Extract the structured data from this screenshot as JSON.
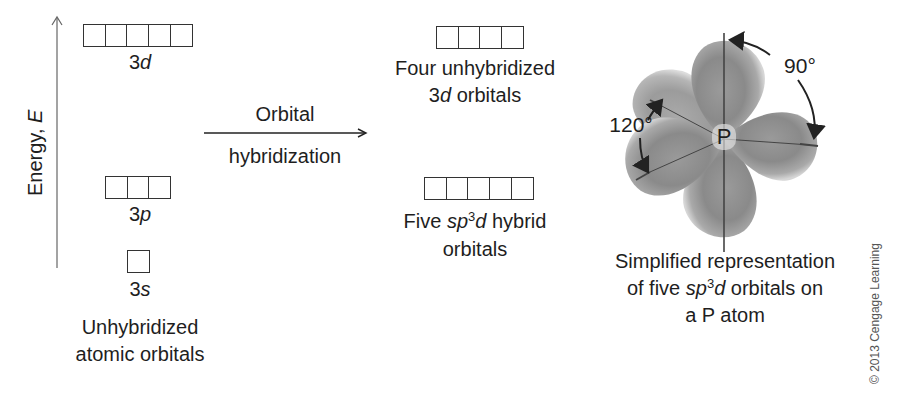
{
  "energy_axis": {
    "label_prefix": "Energy, ",
    "label_var": "E"
  },
  "left_column": {
    "orbitals": [
      {
        "id": "3d",
        "num": "3",
        "letter": "d",
        "box_count": 5
      },
      {
        "id": "3p",
        "num": "3",
        "letter": "p",
        "box_count": 3
      },
      {
        "id": "3s",
        "num": "3",
        "letter": "s",
        "box_count": 1
      }
    ],
    "caption_line1": "Unhybridized",
    "caption_line2": "atomic orbitals"
  },
  "arrow": {
    "label_top": "Orbital",
    "label_bottom": "hybridization"
  },
  "middle_column": {
    "unhybridized": {
      "box_count": 4,
      "line1": "Four unhybridized",
      "line2_num": "3",
      "line2_letter": "d",
      "line2_rest": " orbitals"
    },
    "hybrid": {
      "box_count": 5,
      "line1_prefix": "Five ",
      "line1_sp": "sp",
      "line1_sup": "3",
      "line1_d": "d",
      "line1_rest": " hybrid",
      "line2": "orbitals"
    }
  },
  "right_column": {
    "atom_label": "P",
    "angle_axial": "90°",
    "angle_equatorial": "120°",
    "caption_line1": "Simplified representation",
    "caption_line2_prefix": "of five ",
    "caption_line2_sp": "sp",
    "caption_line2_sup": "3",
    "caption_line2_d": "d",
    "caption_line2_rest": " orbitals on",
    "caption_line3": "a P atom"
  },
  "copyright": "© 2013 Cengage Learning",
  "colors": {
    "ink": "#1e1e1e",
    "lobe_dark": "#7a7a7a",
    "lobe_light": "#c8c8c8"
  }
}
